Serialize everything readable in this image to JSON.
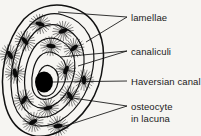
{
  "figure": {
    "background_color": "#f6f5f2",
    "ink_color": "#111111",
    "width": 201,
    "height": 136
  },
  "labels": [
    {
      "id": "lamellae",
      "text": "lamellae"
    },
    {
      "id": "canaliculi",
      "text": "canaliculi"
    },
    {
      "id": "haversian",
      "text": "Haversian canal"
    },
    {
      "id": "osteocyte",
      "line1": "osteocyte",
      "line2": "in lacuna"
    }
  ],
  "diagram": {
    "haversian_canal": {
      "name": "haversian-canal",
      "fill": "#000000",
      "cx": 44,
      "cy": 82,
      "rx": 9,
      "ry": 10.5
    },
    "lamellae_rings": [
      {
        "cx": 56,
        "cy": 68,
        "rx": 52,
        "ry": 60,
        "rot": -22
      },
      {
        "cx": 54,
        "cy": 70,
        "rx": 43,
        "ry": 50,
        "rot": -22
      },
      {
        "cx": 51,
        "cy": 73,
        "rx": 33,
        "ry": 39,
        "rot": -22
      },
      {
        "cx": 48,
        "cy": 77,
        "rx": 23,
        "ry": 28,
        "rot": -22
      },
      {
        "cx": 45,
        "cy": 80,
        "rx": 14,
        "ry": 18,
        "rot": -22
      }
    ],
    "osteocytes": [
      {
        "cx": 40,
        "cy": 24,
        "rot": 15
      },
      {
        "cx": 63,
        "cy": 31,
        "rot": -20
      },
      {
        "cx": 25,
        "cy": 41,
        "rot": 50
      },
      {
        "cx": 51,
        "cy": 46,
        "rot": 5
      },
      {
        "cx": 74,
        "cy": 48,
        "rot": -40
      },
      {
        "cx": 15,
        "cy": 73,
        "rot": 80
      },
      {
        "cx": 66,
        "cy": 70,
        "rot": -65
      },
      {
        "cx": 24,
        "cy": 100,
        "rot": 120
      },
      {
        "cx": 48,
        "cy": 108,
        "rot": 165
      },
      {
        "cx": 70,
        "cy": 96,
        "rot": -120
      },
      {
        "cx": 33,
        "cy": 122,
        "rot": 150
      },
      {
        "cx": 58,
        "cy": 126,
        "rot": 175
      }
    ],
    "leader_lines": [
      {
        "name": "leader-lamellae-a",
        "x1": 58,
        "y1": 12,
        "x2": 127,
        "y2": 17
      },
      {
        "name": "leader-lamellae-b",
        "x1": 86,
        "y1": 42,
        "x2": 127,
        "y2": 17
      },
      {
        "name": "leader-canaliculi-a",
        "x1": 60,
        "y1": 57,
        "x2": 127,
        "y2": 51
      },
      {
        "name": "leader-canaliculi-b",
        "x1": 78,
        "y1": 65,
        "x2": 127,
        "y2": 51
      },
      {
        "name": "leader-haversian",
        "x1": 53,
        "y1": 82,
        "x2": 127,
        "y2": 81
      },
      {
        "name": "leader-osteocyte-a",
        "x1": 66,
        "y1": 98,
        "x2": 127,
        "y2": 106
      },
      {
        "name": "leader-osteocyte-b",
        "x1": 61,
        "y1": 126,
        "x2": 127,
        "y2": 106
      }
    ]
  }
}
